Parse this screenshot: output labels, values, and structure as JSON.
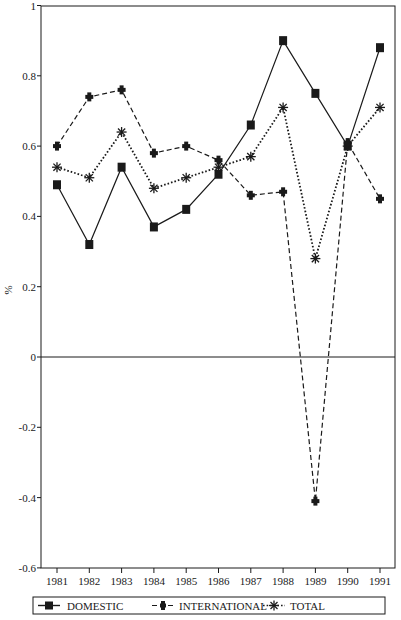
{
  "chart_data": {
    "type": "line",
    "title": "",
    "xlabel": "",
    "ylabel": "%",
    "x": [
      1981,
      1982,
      1983,
      1984,
      1985,
      1986,
      1987,
      1988,
      1989,
      1990,
      1991
    ],
    "categories": [
      "1981",
      "1982",
      "1983",
      "1984",
      "1985",
      "1986",
      "1987",
      "1988",
      "1989",
      "1990",
      "1991"
    ],
    "ylim": [
      -0.6,
      1
    ],
    "yticks": [
      -0.6,
      -0.4,
      -0.2,
      0,
      0.2,
      0.4,
      0.6,
      0.8,
      1
    ],
    "ytick_labels": [
      "-0.6",
      "-0.4",
      "-0.2",
      "0",
      "0.2",
      "0.4",
      "0.6",
      "0.8",
      "1"
    ],
    "grid": false,
    "zero_line": true,
    "legend_position": "bottom",
    "series": [
      {
        "name": "DOMESTIC",
        "line_style": "solid",
        "marker": "square",
        "values": [
          0.49,
          0.32,
          0.54,
          0.37,
          0.42,
          0.52,
          0.66,
          0.9,
          0.75,
          0.6,
          0.88
        ]
      },
      {
        "name": "INTERNATIONAL",
        "line_style": "dashed",
        "marker": "plus",
        "values": [
          0.6,
          0.74,
          0.76,
          0.58,
          0.6,
          0.56,
          0.46,
          0.47,
          -0.41,
          0.61,
          0.45
        ]
      },
      {
        "name": "TOTAL",
        "line_style": "dotted",
        "marker": "asterisk",
        "values": [
          0.54,
          0.51,
          0.64,
          0.48,
          0.51,
          0.54,
          0.57,
          0.71,
          0.28,
          0.6,
          0.71
        ]
      }
    ]
  },
  "legend": {
    "items": [
      {
        "label": "DOMESTIC"
      },
      {
        "label": "INTERNATIONAL"
      },
      {
        "label": "TOTAL"
      }
    ]
  },
  "axis": {
    "y_label": "%"
  },
  "colors": {
    "ink": "#1a1a1a",
    "background": "#ffffff"
  }
}
